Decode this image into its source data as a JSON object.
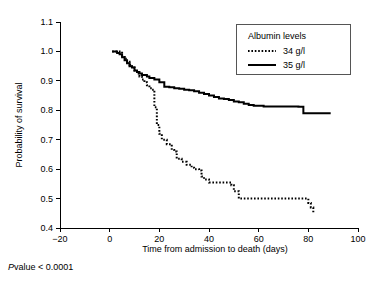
{
  "figure": {
    "footnote_p_symbol": "P",
    "footnote_rest": "value < 0.0001"
  },
  "legend": {
    "title": "Albumin levels",
    "entries": [
      {
        "label": "34 g/l",
        "style": "dotted"
      },
      {
        "label": "35 g/l",
        "style": "solid"
      }
    ]
  },
  "chart_data": {
    "type": "line",
    "title": "",
    "subtitle": "",
    "xlabel": "Time from admission to death (days)",
    "ylabel": "Probability of survival",
    "xlim": [
      -20,
      100
    ],
    "ylim": [
      0.4,
      1.1
    ],
    "xticks": [
      -20,
      0,
      20,
      40,
      60,
      80,
      100
    ],
    "xtick_labels": [
      "−20",
      "0",
      "20",
      "40",
      "60",
      "80",
      "100"
    ],
    "yticks": [
      0.4,
      0.5,
      0.6,
      0.7,
      0.8,
      0.9,
      1.0,
      1.1
    ],
    "ytick_labels": [
      "0.4",
      "0.5",
      "0.6",
      "0.7",
      "0.8",
      "0.9",
      "1.0",
      "1.1"
    ],
    "grid": false,
    "legend_position": "top-right",
    "legend_title": "Albumin levels",
    "annotations": [
      "P value < 0.0001"
    ],
    "series": [
      {
        "name": "34 g/l",
        "style": "dotted",
        "step": "post",
        "x": [
          1,
          3,
          5,
          6,
          7,
          8,
          9,
          10,
          11,
          12,
          13,
          14,
          15,
          16,
          17,
          18,
          19,
          20,
          21,
          23,
          25,
          26,
          27,
          29,
          31,
          33,
          34,
          36,
          37,
          38,
          40,
          44,
          47,
          49,
          50,
          52,
          74,
          77,
          79,
          80,
          81,
          82
        ],
        "y": [
          1.0,
          1.0,
          0.985,
          0.975,
          0.965,
          0.955,
          0.945,
          0.935,
          0.925,
          0.915,
          0.905,
          0.895,
          0.885,
          0.875,
          0.87,
          0.81,
          0.75,
          0.72,
          0.7,
          0.685,
          0.665,
          0.66,
          0.635,
          0.625,
          0.615,
          0.605,
          0.6,
          0.595,
          0.575,
          0.565,
          0.555,
          0.555,
          0.555,
          0.545,
          0.525,
          0.5,
          0.5,
          0.5,
          0.5,
          0.485,
          0.47,
          0.45
        ]
      },
      {
        "name": "35 g/l",
        "style": "solid",
        "step": "post",
        "x": [
          1,
          3,
          4,
          5,
          6,
          7,
          8,
          9,
          10,
          11,
          12,
          13,
          15,
          16,
          18,
          20,
          22,
          24,
          26,
          28,
          30,
          32,
          34,
          36,
          38,
          40,
          42,
          44,
          46,
          48,
          50,
          52,
          54,
          56,
          58,
          62,
          66,
          70,
          74,
          76,
          78,
          89
        ],
        "y": [
          1.0,
          0.995,
          0.99,
          0.98,
          0.97,
          0.96,
          0.95,
          0.945,
          0.935,
          0.93,
          0.925,
          0.92,
          0.915,
          0.91,
          0.905,
          0.895,
          0.88,
          0.878,
          0.875,
          0.873,
          0.87,
          0.868,
          0.865,
          0.86,
          0.855,
          0.85,
          0.845,
          0.84,
          0.838,
          0.835,
          0.83,
          0.827,
          0.822,
          0.818,
          0.815,
          0.813,
          0.813,
          0.813,
          0.813,
          0.812,
          0.79,
          0.79
        ]
      }
    ]
  }
}
